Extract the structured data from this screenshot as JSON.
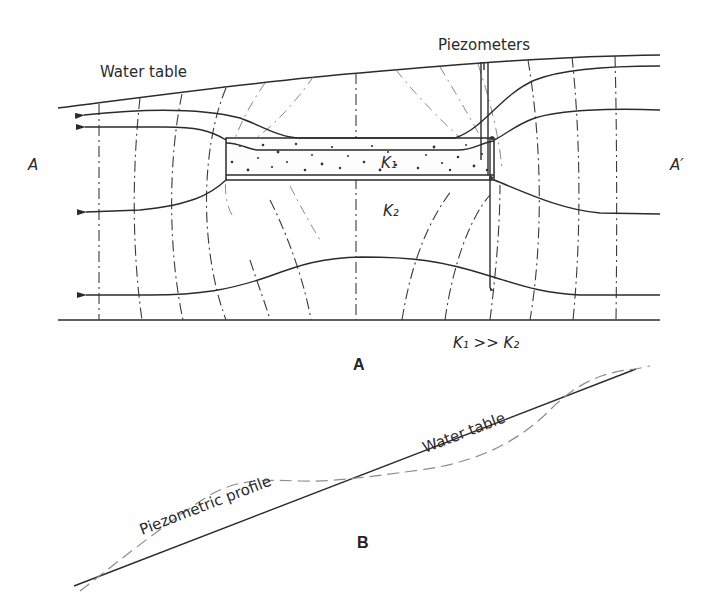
{
  "figure": {
    "panel_a": {
      "label": "A",
      "water_table_label": "Water table",
      "piezometers_label": "Piezometers",
      "section_start_label": "A",
      "section_end_label": "A′",
      "lens_label": "K₁",
      "matrix_label": "K₂",
      "relation_label": "K₁ >> K₂"
    },
    "panel_b": {
      "label": "B",
      "water_table_label": "Water table",
      "profile_label": "Piezometric profile"
    },
    "colors": {
      "line": "#2b2b2b",
      "dashed_light": "#8c8c8c",
      "background": "#ffffff"
    }
  }
}
